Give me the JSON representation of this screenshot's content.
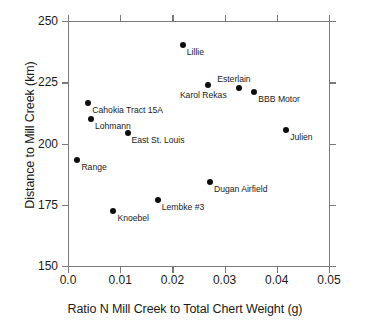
{
  "chart_data": {
    "type": "scatter",
    "title": "",
    "xlabel": "Ratio N Mill Creek to Total Chert Weight (g)",
    "ylabel": "Distance to Mill Creek (km)",
    "xlim": [
      0.0,
      0.05
    ],
    "ylim": [
      150,
      250
    ],
    "xticks": [
      "0.0",
      "0.01",
      "0.02",
      "0.03",
      "0.04",
      "0.05"
    ],
    "xtick_values": [
      0.0,
      0.01,
      0.02,
      0.03,
      0.04,
      0.05
    ],
    "yticks": [
      "250",
      "225",
      "200",
      "175",
      "150"
    ],
    "ytick_values": [
      250,
      225,
      200,
      175,
      150
    ],
    "grid": false,
    "legend": "none",
    "marker_color": "#0d0d0d",
    "axis_color": "#7a7a7a",
    "points": [
      {
        "label": "Lillie",
        "x": 0.022,
        "y": 240.2,
        "label_pos": "below-right"
      },
      {
        "label": "Esterlain",
        "x": 0.0328,
        "y": 222.8,
        "label_pos": "above-center"
      },
      {
        "label": "BBB Motor",
        "x": 0.0357,
        "y": 221.1,
        "label_pos": "below-right"
      },
      {
        "label": "Karol Rekas",
        "x": 0.0268,
        "y": 224.0,
        "label_pos": "below-left"
      },
      {
        "label": "Cahokia Tract 15A",
        "x": 0.0039,
        "y": 216.7,
        "label_pos": "below-right"
      },
      {
        "label": "Lohmann",
        "x": 0.0044,
        "y": 210.2,
        "label_pos": "below-right"
      },
      {
        "label": "East St. Louis",
        "x": 0.0114,
        "y": 204.1,
        "label_pos": "below-right"
      },
      {
        "label": "Julien",
        "x": 0.0418,
        "y": 205.7,
        "label_pos": "below-right"
      },
      {
        "label": "Range",
        "x": 0.0018,
        "y": 193.1,
        "label_pos": "below-right"
      },
      {
        "label": "Dugan Airfield",
        "x": 0.0272,
        "y": 184.1,
        "label_pos": "below-right"
      },
      {
        "label": "Lembke #3",
        "x": 0.0172,
        "y": 176.8,
        "label_pos": "below-right"
      },
      {
        "label": "Knoebel",
        "x": 0.0087,
        "y": 172.4,
        "label_pos": "below-right"
      }
    ]
  }
}
